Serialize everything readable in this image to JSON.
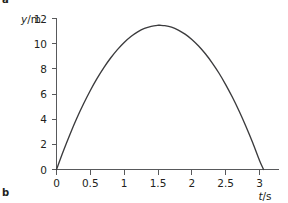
{
  "figure": {
    "panel_label_top": "a",
    "panel_label_bottom": "b"
  },
  "axes": {
    "y_title_variable": "y",
    "y_title_rest": "/m",
    "x_title_variable": "t",
    "x_title_rest": "/s"
  },
  "chart_data": {
    "type": "line",
    "title": "",
    "subtitle": "",
    "xlabel": "t/s",
    "ylabel": "y/m",
    "xlim": [
      0,
      3.25
    ],
    "ylim": [
      0,
      12.6
    ],
    "xticks": [
      0,
      0.5,
      1,
      1.5,
      2,
      2.5,
      3
    ],
    "xtick_labels": [
      "0",
      "0.5",
      "1",
      "1.5",
      "2",
      "2.5",
      "3"
    ],
    "yticks": [
      0,
      2,
      4,
      6,
      8,
      10,
      12
    ],
    "ytick_labels": [
      "0",
      "2",
      "4",
      "6",
      "8",
      "10",
      "12"
    ],
    "grid": false,
    "legend": false,
    "legend_position": "none",
    "annotations": [],
    "series": [
      {
        "name": "vertical displacement",
        "color": "#3b3b3d",
        "peak_x": 1.53,
        "peak_y": 11.4,
        "x": [
          0,
          0.1,
          0.2,
          0.3,
          0.4,
          0.5,
          0.6,
          0.7,
          0.8,
          0.9,
          1.0,
          1.1,
          1.2,
          1.3,
          1.4,
          1.5,
          1.53,
          1.6,
          1.7,
          1.8,
          1.9,
          2.0,
          2.1,
          2.2,
          2.3,
          2.4,
          2.5,
          2.6,
          2.7,
          2.8,
          2.9,
          3.0,
          3.06
        ],
        "y": [
          0,
          1.45,
          2.81,
          4.07,
          5.22,
          6.28,
          7.24,
          8.1,
          8.86,
          9.53,
          10.1,
          10.57,
          10.94,
          11.21,
          11.38,
          11.46,
          11.46,
          11.43,
          11.31,
          11.08,
          10.76,
          10.34,
          9.82,
          9.2,
          8.48,
          7.67,
          6.75,
          5.74,
          4.63,
          3.42,
          2.12,
          0.71,
          0.0
        ]
      }
    ]
  }
}
